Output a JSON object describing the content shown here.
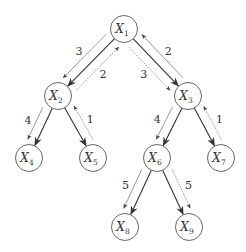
{
  "diagram": {
    "type": "tree message passing",
    "node_radius": 13.5,
    "nodes": [
      {
        "id": "X1",
        "var": "X",
        "sub": "1",
        "x": 124,
        "y": 29
      },
      {
        "id": "X2",
        "var": "X",
        "sub": "2",
        "x": 58,
        "y": 96
      },
      {
        "id": "X3",
        "var": "X",
        "sub": "3",
        "x": 188,
        "y": 96
      },
      {
        "id": "X4",
        "var": "X",
        "sub": "4",
        "x": 29,
        "y": 158
      },
      {
        "id": "X5",
        "var": "X",
        "sub": "5",
        "x": 93,
        "y": 158
      },
      {
        "id": "X6",
        "var": "X",
        "sub": "6",
        "x": 157,
        "y": 158
      },
      {
        "id": "X7",
        "var": "X",
        "sub": "7",
        "x": 221,
        "y": 158
      },
      {
        "id": "X8",
        "var": "X",
        "sub": "8",
        "x": 125,
        "y": 227
      },
      {
        "id": "X9",
        "var": "X",
        "sub": "9",
        "x": 189,
        "y": 227
      }
    ],
    "edges": [
      {
        "from": "X1",
        "to": "X2"
      },
      {
        "from": "X1",
        "to": "X3"
      },
      {
        "from": "X2",
        "to": "X4"
      },
      {
        "from": "X2",
        "to": "X5"
      },
      {
        "from": "X3",
        "to": "X6"
      },
      {
        "from": "X3",
        "to": "X7"
      },
      {
        "from": "X6",
        "to": "X8"
      },
      {
        "from": "X6",
        "to": "X9"
      }
    ],
    "messages": [
      {
        "from": "X1",
        "to": "X2",
        "label": "3",
        "side": "left",
        "style": "solid"
      },
      {
        "from": "X2",
        "to": "X1",
        "label": "2",
        "side": "right",
        "style": "dotted"
      },
      {
        "from": "X1",
        "to": "X3",
        "label": "3",
        "side": "left",
        "style": "dotted"
      },
      {
        "from": "X3",
        "to": "X1",
        "label": "2",
        "side": "right",
        "style": "solid"
      },
      {
        "from": "X2",
        "to": "X4",
        "label": "4",
        "side": "left",
        "style": "solid"
      },
      {
        "from": "X5",
        "to": "X2",
        "label": "1",
        "side": "right",
        "style": "dotted"
      },
      {
        "from": "X3",
        "to": "X6",
        "label": "4",
        "side": "left",
        "style": "solid"
      },
      {
        "from": "X7",
        "to": "X3",
        "label": "1",
        "side": "right",
        "style": "dotted"
      },
      {
        "from": "X6",
        "to": "X8",
        "label": "5",
        "side": "left",
        "style": "solid"
      },
      {
        "from": "X6",
        "to": "X9",
        "label": "5",
        "side": "right",
        "style": "dotted"
      }
    ]
  }
}
